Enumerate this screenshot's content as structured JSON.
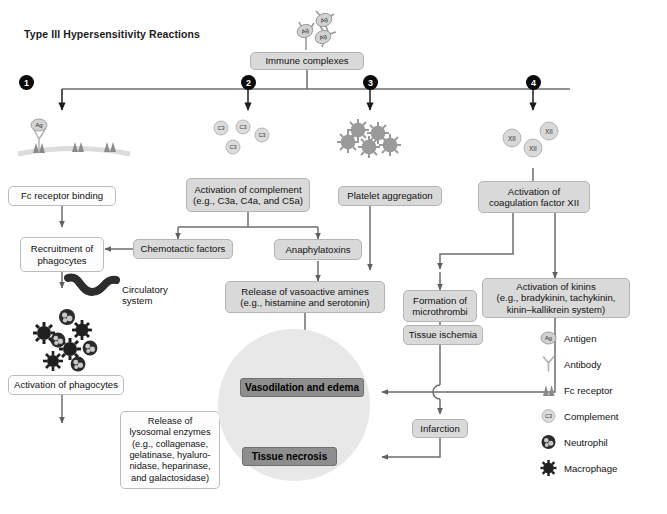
{
  "title": "Type III Hypersensitivity Reactions",
  "top": {
    "immune_complexes": "Immune complexes",
    "antigen_badges": [
      "Ag",
      "Ag",
      "Ag"
    ]
  },
  "markers": [
    {
      "n": "1"
    },
    {
      "n": "2"
    },
    {
      "n": "3"
    },
    {
      "n": "4"
    }
  ],
  "icon_groups": {
    "path1_labels": [
      "Ag"
    ],
    "path2_labels": [
      "C3",
      "C3",
      "C3",
      "C3"
    ],
    "path4_labels": [
      "XII",
      "XII",
      "XII"
    ]
  },
  "boxes": {
    "fc_receptor_binding": "Fc receptor binding",
    "recruitment": "Recruitment of\nphagocytes",
    "activation_phagocytes": "Activation of phagocytes",
    "lysosomal": "Release of\nlysosomal enzymes\n(e.g., collagenase,\ngelatinase, hyaluro-\nnidase, heparinase,\nand galactosidase)",
    "activation_complement": "Activation of complement\n(e.g., C3a, C4a, and C5a)",
    "chemotactic": "Chemotactic factors",
    "anaphylatoxins": "Anaphylatoxins",
    "vasoactive": "Release of vasoactive amines\n(e.g., histamine and serotonin)",
    "platelet": "Platelet aggregation",
    "microthrombi": "Formation of\nmicrothrombi",
    "ischemia": "Tissue ischemia",
    "infarction": "Infarction",
    "coagulation": "Activation of\ncoagulation factor XII",
    "kinins": "Activation of kinins\n(e.g., bradykinin, tachykinin,\nkinin–kallikrein system)",
    "vasodilation": "Vasodilation and edema",
    "necrosis": "Tissue necrosis"
  },
  "annotations": {
    "circulatory_system": "Circulatory\nsystem"
  },
  "legend": {
    "items": [
      {
        "icon": "antigen-icon",
        "label": "Antigen",
        "badge": "Ag"
      },
      {
        "icon": "antibody-icon",
        "label": "Antibody",
        "badge": ""
      },
      {
        "icon": "fc-receptor-icon",
        "label": "Fc receptor",
        "badge": ""
      },
      {
        "icon": "complement-icon",
        "label": "Complement",
        "badge": "C3"
      },
      {
        "icon": "neutrophil-icon",
        "label": "Neutrophil",
        "badge": ""
      },
      {
        "icon": "macrophage-icon",
        "label": "Macrophage",
        "badge": ""
      }
    ]
  },
  "caption": " ",
  "colors": {
    "box_grey": "#d9d9d9",
    "box_white": "#fdfdfd",
    "box_dark": "#8e8e8e",
    "circle_bg": "#e8e8e8",
    "wire": "#6e6e6e",
    "marker": "#0a0a0a"
  }
}
